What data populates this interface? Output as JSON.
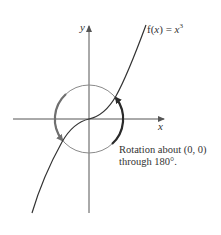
{
  "figure": {
    "function_label": {
      "prefix": "f(",
      "var": "x",
      "middle": ") = ",
      "rhs_var": "x",
      "exponent": "3"
    },
    "axis_labels": {
      "x": "x",
      "y": "y"
    },
    "annotation": {
      "line1": "Rotation about (0, 0)",
      "line2": "through 180°."
    },
    "colors": {
      "axis": "#555555",
      "curve": "#333333",
      "circle": "#8a8a8a",
      "rotation_arrow_right": "#2a2a2a",
      "rotation_arrow_left": "#6f6f6f",
      "text": "#333333"
    },
    "geometry": {
      "origin_px": [
        89,
        119
      ],
      "circle_radius_px": 34
    }
  }
}
